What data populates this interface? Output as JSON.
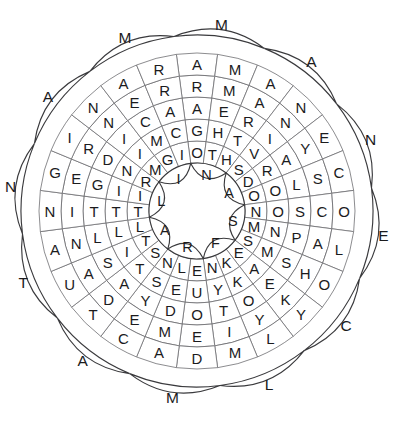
{
  "puzzle": {
    "title": "Circular Word Search Wheel",
    "type": "word-search-wheel",
    "shape": "flower-rosette",
    "sector_count": 24,
    "ring_count": 6,
    "outer_petal_count": 12,
    "inner_petal_count": 8,
    "colors": {
      "background": "#ffffff",
      "cell_fill": "#ffffff",
      "cell_stroke": "#6f6f72",
      "petal_stroke": "#3a3a3d",
      "letter": "#1b1b1d"
    },
    "center": {
      "cx": 197,
      "cy": 211,
      "hole_radius": 48
    },
    "geometry": {
      "ring_radii": [
        48,
        70,
        92,
        114,
        136,
        158,
        176
      ],
      "outer_petal_radius": 196,
      "inner_petal_radius": 40,
      "sector_start_deg": -97.5
    },
    "inner_petals": {
      "label": "innermost scallop letters",
      "letters": [
        "N",
        "A",
        "S",
        "F",
        "R",
        "A",
        "L",
        "I"
      ],
      "angles_deg": [
        248,
        292,
        337,
        22,
        67,
        112,
        157,
        202
      ]
    },
    "rings": [
      {
        "index": 0,
        "name": "ring-1-innermost",
        "letters": [
          "O",
          "T",
          "H",
          "S",
          "D",
          "O",
          "N",
          "M",
          "S",
          "E",
          "K",
          "N",
          "E",
          "L",
          "N",
          "S",
          "T",
          "L",
          "T",
          "I",
          "R",
          "M",
          "G",
          "I"
        ]
      },
      {
        "index": 1,
        "name": "ring-2",
        "letters": [
          "G",
          "H",
          "T",
          "V",
          "R",
          "O",
          "O",
          "N",
          "M",
          "A",
          "K",
          "Y",
          "U",
          "E",
          "S",
          "T",
          "I",
          "L",
          "T",
          "I",
          "N",
          "I",
          "M",
          "C"
        ]
      },
      {
        "index": 2,
        "name": "ring-3",
        "letters": [
          "A",
          "E",
          "R",
          "I",
          "A",
          "L",
          "S",
          "P",
          "S",
          "E",
          "O",
          "T",
          "O",
          "D",
          "Y",
          "A",
          "S",
          "L",
          "T",
          "G",
          "D",
          "I",
          "C",
          "A"
        ]
      },
      {
        "index": 3,
        "name": "ring-4",
        "letters": [
          "R",
          "M",
          "A",
          "N",
          "Y",
          "S",
          "C",
          "A",
          "H",
          "K",
          "Y",
          "I",
          "E",
          "M",
          "E",
          "D",
          "A",
          "N",
          "I",
          "E",
          "R",
          "N",
          "E",
          "R"
        ]
      },
      {
        "index": 4,
        "name": "ring-5-outer-band",
        "letters": [
          "A",
          "M",
          "A",
          "N",
          "E",
          "C",
          "O",
          "L",
          "O",
          "Y",
          "L",
          "M",
          "D",
          "A",
          "C",
          "T",
          "U",
          "A",
          "N",
          "G",
          "I",
          "N",
          "A",
          "R"
        ]
      }
    ],
    "outer_petals": {
      "label": "outermost scallop letters",
      "letters": [
        "M",
        "A",
        "N",
        "E",
        "C",
        "L",
        "M",
        "A",
        "T",
        "N",
        "A",
        "M"
      ],
      "angles_deg": [
        270,
        300,
        330,
        0,
        30,
        60,
        90,
        120,
        150,
        180,
        210,
        240
      ],
      "reading": [
        "M",
        "N",
        "E",
        "C",
        "L",
        "M",
        "A",
        "T",
        "N",
        "A",
        "M",
        "A"
      ]
    },
    "letter_sectors": {
      "note": "24 radial sectors, letters read outward from ring-1 to ring-5 in each sector"
    },
    "hidden_words_visible": [
      "MOTHS",
      "FOOLS",
      "MANE",
      "SALT",
      "CAT",
      "DREAM",
      "MAN",
      "ARMY"
    ]
  },
  "meta": {
    "width": 395,
    "height": 423
  }
}
